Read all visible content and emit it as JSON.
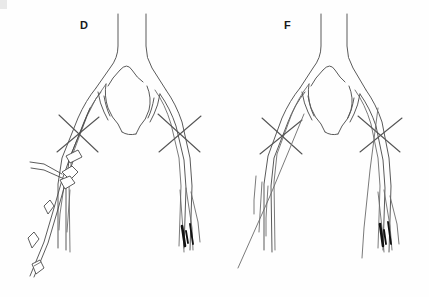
{
  "figure": {
    "background_color": "#fefefe",
    "stroke_color": "#5a5a5a",
    "occlusion_color": "#111111",
    "label_color": "#1a1a1a",
    "width": 429,
    "height": 297
  },
  "panels": [
    {
      "id": "panel-d",
      "label": "D",
      "label_x": 80,
      "label_y": 19,
      "description": "Aortic bifurcation with iliac arteries, bilateral crossed clamp markers, catheter sheath assembly entering left iliac artery, dark occluded distal segments on right",
      "has_catheter": true,
      "anatomy": {
        "aorta_label": "aorta",
        "left_iliac_label": "left iliac artery",
        "right_iliac_label": "right iliac artery",
        "bifurcation_label": "aortic bifurcation"
      },
      "markers": {
        "clamp_left_label": "crossed clamp marker left",
        "clamp_right_label": "crossed clamp marker right",
        "occlusion_label": "occluded distal segment"
      },
      "device": {
        "name": "catheter sheath assembly",
        "hub_label": "sheath hub with side-arm port",
        "sidearm_label": "side-arm port",
        "connector_1_label": "connector bead upper",
        "connector_2_label": "connector bead lower",
        "detached_label": "detached connector piece",
        "wire_label": "guidewire"
      }
    },
    {
      "id": "panel-f",
      "label": "F",
      "label_x": 284,
      "label_y": 19,
      "description": "Aortic bifurcation with iliac arteries, bilateral crossed clamp markers, no catheter, dark occluded distal segments on right",
      "has_catheter": false,
      "anatomy": {
        "aorta_label": "aorta",
        "left_iliac_label": "left iliac artery",
        "right_iliac_label": "right iliac artery",
        "bifurcation_label": "aortic bifurcation"
      },
      "markers": {
        "clamp_left_label": "crossed clamp marker left",
        "clamp_right_label": "crossed clamp marker right",
        "occlusion_label": "occluded distal segment"
      }
    }
  ]
}
